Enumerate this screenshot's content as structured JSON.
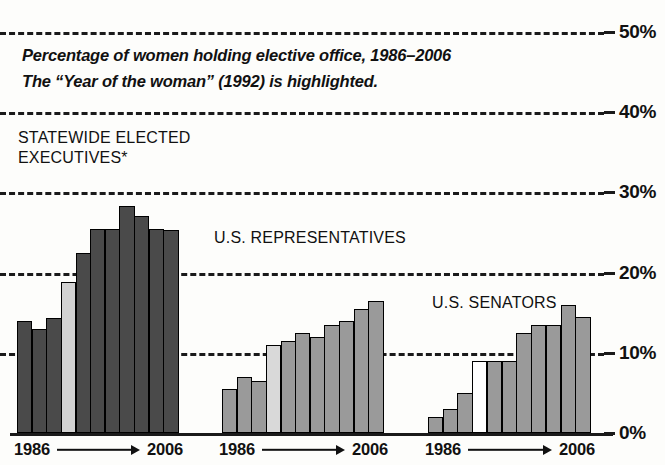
{
  "subtitle_lines": [
    "Percentage of women holding elective office, 1986–2006",
    "The “Year of the woman” (1992) is highlighted."
  ],
  "axis": {
    "y_ticks": [
      "50%",
      "40%",
      "30%",
      "20%",
      "10%",
      "0%"
    ],
    "x_start": "1986",
    "x_end": "2006"
  },
  "colors": {
    "dark_bar": "#4a4a4a",
    "medium_bar": "#9a9a9a",
    "highlight_dark": "#d2d2d2",
    "highlight_medium": "#d9d9d9",
    "highlight_light": "#ffffff",
    "grid": "#1a1a1a",
    "text": "#111111",
    "background": "#fdfdfb"
  },
  "groups": [
    {
      "key": "statewide",
      "label_lines": [
        "STATEWIDE ELECTED",
        "EXECUTIVES*"
      ],
      "label_left": 18,
      "label_top": 128,
      "left": 17,
      "right": 178,
      "bar_fill": "#4a4a4a",
      "highlight_index": 3,
      "highlight_fill": "#d2d2d2",
      "x_start": "1986",
      "x_end": "2006"
    },
    {
      "key": "representatives",
      "label_lines": [
        "U.S. REPRESENTATIVES"
      ],
      "label_left": 214,
      "label_top": 228,
      "left": 222,
      "right": 383,
      "bar_fill": "#9a9a9a",
      "highlight_index": 3,
      "highlight_fill": "#d9d9d9",
      "x_start": "1986",
      "x_end": "2006"
    },
    {
      "key": "senators",
      "label_lines": [
        "U.S. SENATORS"
      ],
      "label_left": 432,
      "label_top": 293,
      "left": 428,
      "right": 590,
      "bar_fill": "#9a9a9a",
      "highlight_index": 3,
      "highlight_fill": "#ffffff",
      "x_start": "1986",
      "x_end": "2006"
    }
  ],
  "chart_data": {
    "type": "bar",
    "title": "Percentage of women holding elective office, 1986–2006",
    "subtitle": "The “Year of the woman” (1992) is highlighted.",
    "xlabel": "",
    "ylabel": "",
    "ylim": [
      0,
      50
    ],
    "yticks": [
      0,
      10,
      20,
      30,
      40,
      50
    ],
    "ytick_labels": [
      "0%",
      "10%",
      "20%",
      "30%",
      "40%",
      "50%"
    ],
    "grid": true,
    "grid_style": "dashed-horizontal",
    "legend": "none",
    "annotation": "Highlighted bar in each group is 1992, the “Year of the woman”.",
    "footnote_marker": "*",
    "categories": [
      1986,
      1988,
      1990,
      1992,
      1994,
      1996,
      1998,
      2000,
      2002,
      2004,
      2006
    ],
    "series": [
      {
        "name": "STATEWIDE ELECTED EXECUTIVES*",
        "values": [
          14.0,
          13.0,
          14.3,
          18.8,
          22.5,
          25.5,
          25.5,
          28.3,
          27.0,
          25.5,
          25.3
        ]
      },
      {
        "name": "U.S. REPRESENTATIVES",
        "values": [
          5.5,
          7.0,
          6.5,
          11.0,
          11.5,
          12.5,
          12.0,
          13.5,
          14.0,
          15.5,
          16.5
        ]
      },
      {
        "name": "U.S. SENATORS",
        "values": [
          2.0,
          3.0,
          5.0,
          9.0,
          9.0,
          9.0,
          12.5,
          13.5,
          13.5,
          16.0,
          14.5
        ]
      }
    ]
  }
}
